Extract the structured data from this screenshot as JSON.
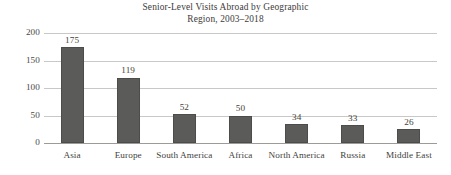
{
  "chart_data": {
    "type": "bar",
    "title": "Senior-Level Visits Abroad by Geographic Region, 2003–2018",
    "title_lines": [
      "Senior-Level Visits Abroad by Geographic",
      "Region, 2003–2018"
    ],
    "categories": [
      "Asia",
      "Europe",
      "South America",
      "Africa",
      "North America",
      "Russia",
      "Middle East"
    ],
    "values": [
      175,
      119,
      52,
      50,
      34,
      33,
      26
    ],
    "value_labels": [
      "175",
      "119",
      "52",
      "50",
      "34",
      "33",
      "26"
    ],
    "xlabel": "",
    "ylabel": "",
    "ylim": [
      0,
      200
    ],
    "y_ticks": [
      0,
      50,
      100,
      150,
      200
    ],
    "y_tick_labels": [
      "0",
      "50",
      "100",
      "150",
      "200"
    ],
    "grid": true,
    "legend": false,
    "bar_color": "#5b5b59",
    "bar_edge_color": "#4c4c4a",
    "gridline_color": "#c8c8c6",
    "axis_color": "#9b9b98",
    "background_color": "#ffffff",
    "text_color": "#3d3b39"
  }
}
